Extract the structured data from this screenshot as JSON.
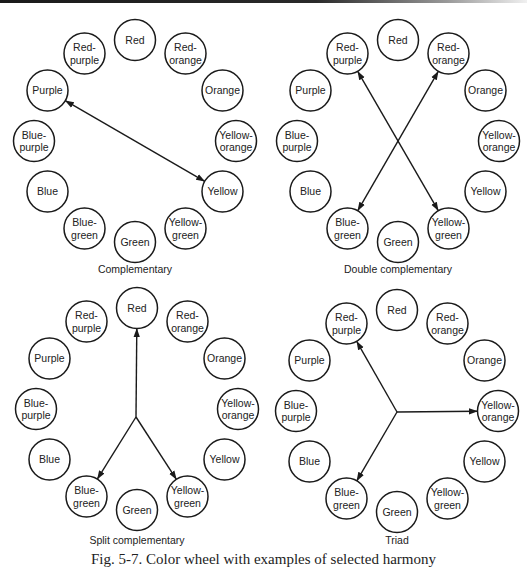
{
  "figure": {
    "caption": "Fig. 5-7. Color wheel with examples of selected harmony",
    "colors": {
      "stroke": "#1a1a1a",
      "text": "#222222",
      "background": "#ffffff"
    }
  },
  "wheel_labels": [
    [
      "Red"
    ],
    [
      "Red-",
      "orange"
    ],
    [
      "Orange"
    ],
    [
      "Yellow-",
      "orange"
    ],
    [
      "Yellow"
    ],
    [
      "Yellow-",
      "green"
    ],
    [
      "Green"
    ],
    [
      "Blue-",
      "green"
    ],
    [
      "Blue"
    ],
    [
      "Blue-",
      "purple"
    ],
    [
      "Purple"
    ],
    [
      "Red-",
      "purple"
    ]
  ],
  "panels": [
    {
      "id": "complementary",
      "title": "Complementary",
      "center": [
        135,
        141
      ],
      "caption_y": 273,
      "arrows": [
        {
          "from": "Purple",
          "to": "Yellow",
          "double": true
        }
      ]
    },
    {
      "id": "double-complementary",
      "title": "Double complementary",
      "center": [
        398,
        141
      ],
      "caption_y": 273,
      "arrows": [
        {
          "from": "Red-purple",
          "to": "Yellow-green",
          "double": true
        },
        {
          "from": "Red-orange",
          "to": "Blue-green",
          "double": true
        }
      ]
    },
    {
      "id": "split-complementary",
      "title": "Split complementary",
      "center": [
        137,
        409
      ],
      "caption_y": 544,
      "hub": [
        136,
        417
      ],
      "arrows": [
        {
          "from": "hub",
          "to": "Red"
        },
        {
          "from": "hub",
          "to": "Blue-green"
        },
        {
          "from": "hub",
          "to": "Yellow-green"
        }
      ]
    },
    {
      "id": "triad",
      "title": "Triad",
      "center": [
        397,
        411
      ],
      "caption_y": 544,
      "hub": [
        397,
        412
      ],
      "arrows": [
        {
          "from": "hub",
          "to": "Red-purple"
        },
        {
          "from": "hub",
          "to": "Yellow-orange"
        },
        {
          "from": "hub",
          "to": "Blue-green"
        }
      ]
    }
  ]
}
